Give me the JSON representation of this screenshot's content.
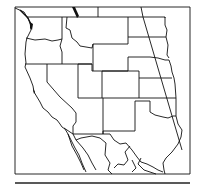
{
  "map": {
    "subject": "Western United States outline map",
    "style": "black line art on white",
    "colors": {
      "background": "#ffffff",
      "line": "#111111"
    },
    "frame": {
      "x": 15,
      "y": 7,
      "width": 175,
      "height": 167
    },
    "second_frame_top_y": 183,
    "regions": [
      "Washington",
      "Oregon",
      "California",
      "Idaho",
      "Nevada",
      "Montana",
      "Wyoming",
      "Utah",
      "Arizona",
      "Colorado",
      "New Mexico",
      "North Dakota",
      "South Dakota",
      "Nebraska",
      "Kansas",
      "Oklahoma",
      "Texas",
      "Mexico (north)",
      "Canada (south)"
    ],
    "annotations": [
      "diagonal meridian line crossing central plains"
    ]
  }
}
